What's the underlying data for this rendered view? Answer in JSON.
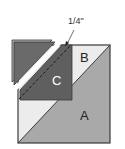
{
  "diagram": {
    "labels": {
      "a": "A",
      "b": "B",
      "c": "C",
      "seam_allowance": "1/4\""
    },
    "colors": {
      "a_fill": "#a9a9a9",
      "b_fill": "#ececec",
      "c_fill": "#5f5f5f",
      "flap_fill": "#6a6a6a",
      "outline": "#3a3a3a",
      "label_dark": "#222222",
      "label_light": "#ffffff"
    }
  }
}
